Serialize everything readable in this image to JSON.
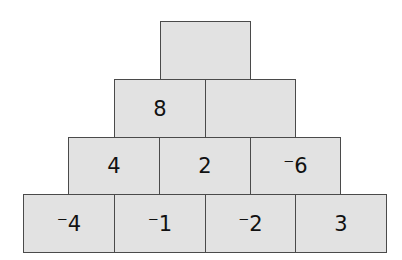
{
  "pyramid": {
    "rows": [
      [
        "",
        ""
      ],
      [
        "8",
        ""
      ],
      [
        "4",
        "2",
        "⁻6"
      ],
      [
        "⁻4",
        "⁻1",
        "⁻2",
        "3"
      ]
    ],
    "top": "",
    "fill_color": "#e2e2e2",
    "border_color": "#4a4a4a"
  }
}
